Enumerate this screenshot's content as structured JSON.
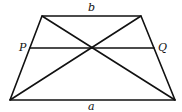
{
  "diagram": {
    "type": "trapezoid",
    "stroke_color": "#111111",
    "vertices": {
      "top_left": [
        42,
        16
      ],
      "top_right": [
        141,
        16
      ],
      "bottom_left": [
        10,
        100
      ],
      "bottom_right": [
        175,
        100
      ]
    },
    "diagonal_intersection": [
      92,
      48
    ],
    "segment_PQ": {
      "from": [
        30,
        48
      ],
      "to": [
        154,
        48
      ]
    },
    "labels": {
      "top_side": "b",
      "bottom_side": "a",
      "left_point": "P",
      "right_point": "Q"
    }
  }
}
